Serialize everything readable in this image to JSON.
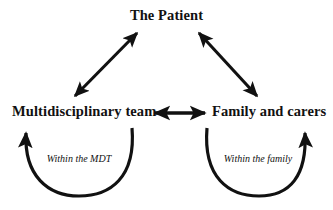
{
  "diagram": {
    "type": "relationship-triad-diagram",
    "background_color": "#ffffff",
    "stroke_color": "#111111",
    "nodes": [
      {
        "id": "patient",
        "label": "The Patient",
        "style": "bold",
        "position": "top-center"
      },
      {
        "id": "mdt",
        "label": "Multidisciplinary team",
        "style": "bold",
        "position": "bottom-left"
      },
      {
        "id": "family",
        "label": "Family and carers",
        "style": "bold",
        "position": "bottom-right"
      }
    ],
    "connectors": [
      {
        "id": "mdt-patient",
        "from": "mdt",
        "to": "patient",
        "arrow": "double",
        "shape": "diagonal"
      },
      {
        "id": "patient-family",
        "from": "patient",
        "to": "family",
        "arrow": "double",
        "shape": "diagonal"
      },
      {
        "id": "mdt-family",
        "from": "mdt",
        "to": "family",
        "arrow": "double",
        "shape": "horizontal"
      }
    ],
    "self_loops": [
      {
        "id": "mdt-loop",
        "node": "mdt",
        "caption": "Within the MDT",
        "arrow": "single",
        "shape": "u-arc",
        "style": "italic"
      },
      {
        "id": "family-loop",
        "node": "family",
        "caption": "Within the family",
        "arrow": "single",
        "shape": "u-arc",
        "style": "italic"
      }
    ]
  }
}
